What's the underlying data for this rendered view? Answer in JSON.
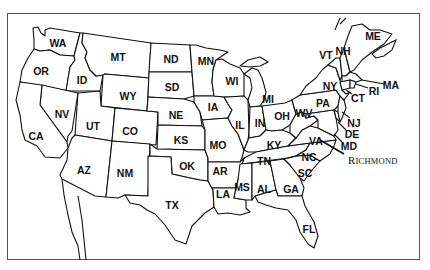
{
  "map": {
    "title": "United States (contiguous)",
    "states": [
      {
        "code": "WA",
        "x": 58,
        "y": 43
      },
      {
        "code": "OR",
        "x": 41,
        "y": 71
      },
      {
        "code": "ID",
        "x": 82,
        "y": 80
      },
      {
        "code": "MT",
        "x": 118,
        "y": 57
      },
      {
        "code": "WY",
        "x": 128,
        "y": 96
      },
      {
        "code": "ND",
        "x": 171,
        "y": 59
      },
      {
        "code": "SD",
        "x": 172,
        "y": 87
      },
      {
        "code": "NE",
        "x": 176,
        "y": 115
      },
      {
        "code": "MN",
        "x": 206,
        "y": 61
      },
      {
        "code": "WI",
        "x": 232,
        "y": 81
      },
      {
        "code": "MI",
        "x": 268,
        "y": 99
      },
      {
        "code": "IA",
        "x": 213,
        "y": 107
      },
      {
        "code": "IL",
        "x": 240,
        "y": 125
      },
      {
        "code": "IN",
        "x": 260,
        "y": 123
      },
      {
        "code": "OH",
        "x": 282,
        "y": 116
      },
      {
        "code": "NV",
        "x": 62,
        "y": 114
      },
      {
        "code": "UT",
        "x": 93,
        "y": 126
      },
      {
        "code": "CO",
        "x": 130,
        "y": 131
      },
      {
        "code": "KS",
        "x": 181,
        "y": 140
      },
      {
        "code": "MO",
        "x": 218,
        "y": 145
      },
      {
        "code": "KY",
        "x": 274,
        "y": 145
      },
      {
        "code": "WV",
        "x": 304,
        "y": 113
      },
      {
        "code": "PA",
        "x": 323,
        "y": 103
      },
      {
        "code": "NY",
        "x": 330,
        "y": 86
      },
      {
        "code": "VT",
        "x": 326,
        "y": 55
      },
      {
        "code": "NH",
        "x": 343,
        "y": 51
      },
      {
        "code": "ME",
        "x": 373,
        "y": 36
      },
      {
        "code": "MA",
        "x": 391,
        "y": 85
      },
      {
        "code": "RI",
        "x": 374,
        "y": 91
      },
      {
        "code": "CT",
        "x": 358,
        "y": 98
      },
      {
        "code": "NJ",
        "x": 354,
        "y": 123
      },
      {
        "code": "DE",
        "x": 352,
        "y": 134
      },
      {
        "code": "MD",
        "x": 349,
        "y": 146
      },
      {
        "code": "VA",
        "x": 316,
        "y": 141
      },
      {
        "code": "NC",
        "x": 309,
        "y": 157
      },
      {
        "code": "SC",
        "x": 305,
        "y": 173
      },
      {
        "code": "TN",
        "x": 264,
        "y": 161
      },
      {
        "code": "AR",
        "x": 220,
        "y": 171
      },
      {
        "code": "OK",
        "x": 187,
        "y": 166
      },
      {
        "code": "LA",
        "x": 223,
        "y": 194
      },
      {
        "code": "MS",
        "x": 242,
        "y": 187
      },
      {
        "code": "AL",
        "x": 264,
        "y": 189
      },
      {
        "code": "GA",
        "x": 291,
        "y": 189
      },
      {
        "code": "FL",
        "x": 309,
        "y": 229
      },
      {
        "code": "CA",
        "x": 36,
        "y": 136
      },
      {
        "code": "AZ",
        "x": 84,
        "y": 170
      },
      {
        "code": "NM",
        "x": 125,
        "y": 173
      },
      {
        "code": "TX",
        "x": 172,
        "y": 205
      }
    ],
    "city": {
      "name": "Richmond",
      "first": "R",
      "rest": "ICHMOND",
      "x": 348,
      "y": 155
    }
  }
}
